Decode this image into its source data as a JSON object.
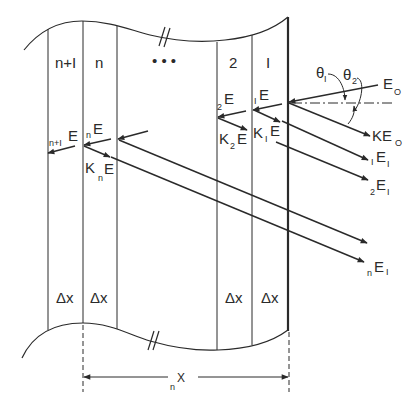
{
  "diagram": {
    "layers": [
      {
        "label": "n+I",
        "thickness_label": "Δx"
      },
      {
        "label": "n",
        "thickness_label": "Δx"
      },
      {
        "label": "• • •",
        "thickness_label": ""
      },
      {
        "label": "2",
        "thickness_label": "Δx"
      },
      {
        "label": "I",
        "thickness_label": "Δx"
      }
    ],
    "angles": {
      "theta1": "θ",
      "theta1_sub": "I",
      "theta2": "θ",
      "theta2_sub": "2"
    },
    "incident": {
      "main": "E",
      "sub": "O"
    },
    "reflected": {
      "prefix": "KE",
      "sub": "O"
    },
    "inward_labels": [
      {
        "pre": "I",
        "main": "E"
      },
      {
        "pre": "2",
        "main": "E"
      },
      {
        "pre": "n",
        "main": "E"
      },
      {
        "pre": "n+I",
        "main": "E"
      }
    ],
    "k_labels": [
      {
        "k": "K",
        "sub": "I",
        "main": "E"
      },
      {
        "k": "K",
        "sub": "2",
        "main": "E"
      },
      {
        "k": "K",
        "sub": "n",
        "main": "E"
      }
    ],
    "outgoing_labels": [
      {
        "pre": "I",
        "main": "E",
        "sub": "I"
      },
      {
        "pre": "2",
        "main": "E",
        "sub": "I"
      },
      {
        "pre": "n",
        "main": "E",
        "sub": "I"
      }
    ],
    "dimension": {
      "pre": "n",
      "main": "X"
    }
  }
}
